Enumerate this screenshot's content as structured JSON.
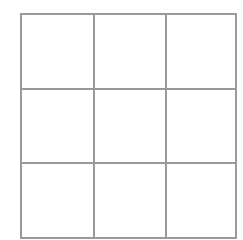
{
  "game": {
    "name": "tic-tac-toe",
    "rows": 3,
    "cols": 3,
    "cells": [
      "",
      "",
      "",
      "",
      "",
      "",
      "",
      "",
      ""
    ]
  },
  "colors": {
    "grid_line": "#9a9a9a",
    "background": "#ffffff"
  }
}
